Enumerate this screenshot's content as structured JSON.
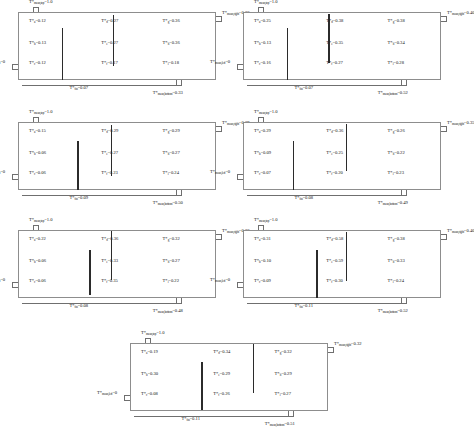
{
  "figure": {
    "symbol": "T*",
    "equals": "="
  },
  "panels": [
    {
      "id": "panel-1",
      "x": 18,
      "y": 12,
      "w": 198,
      "h": 68,
      "boundaries": {
        "top": {
          "sub": "mean,top",
          "value": "1.0",
          "label": "T*",
          "text": "T*mean,top=1.0"
        },
        "left": {
          "sub": "mean,left",
          "value": "0",
          "label": "T*",
          "text": "T*mean,left=0"
        },
        "right": {
          "sub": "mean,right",
          "value": "0.36",
          "label": "T*",
          "text": "T*mean,right=0.36"
        },
        "bottom": {
          "sub": "mean,bottom",
          "value": "0.33",
          "label": "T*",
          "text": "T*mean,bottom=0.33"
        },
        "inner": {
          "sub": "fin",
          "value": "0.07",
          "label": "T*",
          "text": "T*fin=0.07"
        }
      },
      "cells": [
        [
          {
            "sub": "a",
            "value": "0.12"
          },
          {
            "sub": "d",
            "value": "0.27"
          },
          {
            "sub": "g",
            "value": "0.36"
          }
        ],
        [
          {
            "sub": "b",
            "value": "0.13"
          },
          {
            "sub": "e",
            "value": "0.27"
          },
          {
            "sub": "h",
            "value": "0.36"
          }
        ],
        [
          {
            "sub": "c",
            "value": "0.12"
          },
          {
            "sub": "f",
            "value": "0.17"
          },
          {
            "sub": "i",
            "value": "0.18"
          }
        ]
      ],
      "bars": [
        {
          "xpct": 0.22,
          "ytop": 0.24,
          "ybot": 1.0
        },
        {
          "xpct": 0.48,
          "ytop": 0.05,
          "ybot": 0.8
        }
      ]
    },
    {
      "id": "panel-2",
      "x": 243,
      "y": 12,
      "w": 198,
      "h": 68,
      "boundaries": {
        "top": {
          "sub": "mean,top",
          "value": "1.0",
          "label": "T*",
          "text": "T*mean,top=1.0"
        },
        "left": {
          "sub": "mean,left",
          "value": "0",
          "label": "T*",
          "text": "T*mean,left=0"
        },
        "right": {
          "sub": "mean,right",
          "value": "0.40",
          "label": "T*",
          "text": "T*mean,right=0.40"
        },
        "bottom": {
          "sub": "mean,bottom",
          "value": "0.52",
          "label": "T*",
          "text": "T*mean,bottom=0.52"
        },
        "inner": {
          "sub": "fin",
          "value": "0.07",
          "label": "T*",
          "text": "T*fin=0.07"
        }
      },
      "cells": [
        [
          {
            "sub": "a",
            "value": "0.25"
          },
          {
            "sub": "d",
            "value": "0.38"
          },
          {
            "sub": "g",
            "value": "0.38"
          }
        ],
        [
          {
            "sub": "b",
            "value": "0.13"
          },
          {
            "sub": "e",
            "value": "0.35"
          },
          {
            "sub": "h",
            "value": "0.34"
          }
        ],
        [
          {
            "sub": "c",
            "value": "0.16"
          },
          {
            "sub": "f",
            "value": "0.27"
          },
          {
            "sub": "i",
            "value": "0.28"
          }
        ]
      ],
      "bars": [
        {
          "xpct": 0.22,
          "ytop": 0.24,
          "ybot": 1.0
        },
        {
          "xpct": 0.43,
          "ytop": 0.03,
          "ybot": 0.75
        }
      ]
    },
    {
      "id": "panel-3",
      "x": 18,
      "y": 122,
      "w": 198,
      "h": 68,
      "boundaries": {
        "top": {
          "sub": "mean,top",
          "value": "1.0",
          "label": "T*",
          "text": "T*mean,top=1.0"
        },
        "left": {
          "sub": "mean,left",
          "value": "0",
          "label": "T*",
          "text": "T*mean,left=0"
        },
        "right": {
          "sub": "mean,right",
          "value": "0.29",
          "label": "T*",
          "text": "T*mean,right=0.29"
        },
        "bottom": {
          "sub": "mean,bottom",
          "value": "0.50",
          "label": "T*",
          "text": "T*mean,bottom=0.50"
        },
        "inner": {
          "sub": "fin",
          "value": "0.09",
          "label": "T*",
          "text": "T*fin=0.09"
        }
      },
      "cells": [
        [
          {
            "sub": "a",
            "value": "0.15"
          },
          {
            "sub": "d",
            "value": "0.29"
          },
          {
            "sub": "g",
            "value": "0.29"
          }
        ],
        [
          {
            "sub": "b",
            "value": "0.06"
          },
          {
            "sub": "e",
            "value": "0.27"
          },
          {
            "sub": "h",
            "value": "0.27"
          }
        ],
        [
          {
            "sub": "c",
            "value": "0.06"
          },
          {
            "sub": "f",
            "value": "0.23"
          },
          {
            "sub": "i",
            "value": "0.24"
          }
        ]
      ],
      "bars": [
        {
          "xpct": 0.3,
          "ytop": 0.28,
          "ybot": 1.0
        },
        {
          "xpct": 0.47,
          "ytop": 0.05,
          "ybot": 0.8
        }
      ]
    },
    {
      "id": "panel-4",
      "x": 243,
      "y": 122,
      "w": 198,
      "h": 68,
      "boundaries": {
        "top": {
          "sub": "mean,top",
          "value": "1.0",
          "label": "T*",
          "text": "T*mean,top=1.0"
        },
        "left": {
          "sub": "mean,left",
          "value": "0",
          "label": "T*",
          "text": "T*mean,left=0"
        },
        "right": {
          "sub": "mean,right",
          "value": "0.35",
          "label": "T*",
          "text": "T*mean,right=0.35"
        },
        "bottom": {
          "sub": "mean,bottom",
          "value": "0.49",
          "label": "T*",
          "text": "T*mean,bottom=0.49"
        },
        "inner": {
          "sub": "fin",
          "value": "0.08",
          "label": "T*",
          "text": "T*fin=0.08"
        }
      },
      "cells": [
        [
          {
            "sub": "a",
            "value": "0.29"
          },
          {
            "sub": "d",
            "value": "0.36"
          },
          {
            "sub": "g",
            "value": "0.26"
          }
        ],
        [
          {
            "sub": "b",
            "value": "0.09"
          },
          {
            "sub": "e",
            "value": "0.25"
          },
          {
            "sub": "h",
            "value": "0.22"
          }
        ],
        [
          {
            "sub": "c",
            "value": "0.07"
          },
          {
            "sub": "f",
            "value": "0.20"
          },
          {
            "sub": "i",
            "value": "0.23"
          }
        ]
      ],
      "bars": [
        {
          "xpct": 0.25,
          "ytop": 0.28,
          "ybot": 1.0
        },
        {
          "xpct": 0.52,
          "ytop": 0.03,
          "ybot": 0.72
        }
      ]
    },
    {
      "id": "panel-5",
      "x": 18,
      "y": 230,
      "w": 198,
      "h": 68,
      "boundaries": {
        "top": {
          "sub": "mean,top",
          "value": "1.0",
          "label": "T*",
          "text": "T*mean,top=1.0"
        },
        "left": {
          "sub": "mean,left",
          "value": "0",
          "label": "T*",
          "text": "T*mean,left=0"
        },
        "right": {
          "sub": "mean,right",
          "value": "0.36",
          "label": "T*",
          "text": "T*mean,right=0.36"
        },
        "bottom": {
          "sub": "mean,bottom",
          "value": "0.48",
          "label": "T*",
          "text": "T*mean,bottom=0.48"
        },
        "inner": {
          "sub": "fin",
          "value": "0.08",
          "label": "T*",
          "text": "T*fin=0.08"
        }
      },
      "cells": [
        [
          {
            "sub": "a",
            "value": "0.22"
          },
          {
            "sub": "d",
            "value": "0.36"
          },
          {
            "sub": "g",
            "value": "0.32"
          }
        ],
        [
          {
            "sub": "b",
            "value": "0.06"
          },
          {
            "sub": "e",
            "value": "0.33"
          },
          {
            "sub": "h",
            "value": "0.27"
          }
        ],
        [
          {
            "sub": "c",
            "value": "0.06"
          },
          {
            "sub": "f",
            "value": "0.35"
          },
          {
            "sub": "i",
            "value": "0.22"
          }
        ]
      ],
      "bars": [
        {
          "xpct": 0.36,
          "ytop": 0.3,
          "ybot": 0.95
        },
        {
          "xpct": 0.47,
          "ytop": 0.02,
          "ybot": 0.74
        }
      ]
    },
    {
      "id": "panel-6",
      "x": 243,
      "y": 230,
      "w": 198,
      "h": 68,
      "boundaries": {
        "top": {
          "sub": "mean,top",
          "value": "1.0",
          "label": "T*",
          "text": "T*mean,top=1.0"
        },
        "left": {
          "sub": "mean,left",
          "value": "0",
          "label": "T*",
          "text": "T*mean,left=0"
        },
        "right": {
          "sub": "mean,right",
          "value": "0.40",
          "label": "T*",
          "text": "T*mean,right=0.40"
        },
        "bottom": {
          "sub": "mean,bottom",
          "value": "0.52",
          "label": "T*",
          "text": "T*mean,bottom=0.52"
        },
        "inner": {
          "sub": "fin",
          "value": "0.11",
          "label": "T*",
          "text": "T*fin=0.11"
        }
      },
      "cells": [
        [
          {
            "sub": "a",
            "value": "0.31"
          },
          {
            "sub": "d",
            "value": "0.58"
          },
          {
            "sub": "g",
            "value": "0.38"
          }
        ],
        [
          {
            "sub": "b",
            "value": "0.10"
          },
          {
            "sub": "e",
            "value": "0.59"
          },
          {
            "sub": "h",
            "value": "0.33"
          }
        ],
        [
          {
            "sub": "c",
            "value": "0.09"
          },
          {
            "sub": "f",
            "value": "0.30"
          },
          {
            "sub": "i",
            "value": "0.24"
          }
        ]
      ],
      "bars": [
        {
          "xpct": 0.37,
          "ytop": 0.3,
          "ybot": 1.0
        },
        {
          "xpct": 0.52,
          "ytop": 0.03,
          "ybot": 0.75
        }
      ]
    },
    {
      "id": "panel-7",
      "x": 130,
      "y": 343,
      "w": 198,
      "h": 68,
      "boundaries": {
        "top": {
          "sub": "mean,top",
          "value": "1.0",
          "label": "T*",
          "text": "T*mean,top=1.0"
        },
        "left": {
          "sub": "mean,left",
          "value": "0",
          "label": "T*",
          "text": "T*mean,left=0"
        },
        "right": {
          "sub": "mean,right",
          "value": "0.32",
          "label": "T*",
          "text": "T*mean,right=0.32"
        },
        "bottom": {
          "sub": "mean,bottom",
          "value": "0.51",
          "label": "T*",
          "text": "T*mean,bottom=0.51"
        },
        "inner": {
          "sub": "fin",
          "value": "0.11",
          "label": "T*",
          "text": "T*fin=0.11"
        }
      },
      "cells": [
        [
          {
            "sub": "a",
            "value": "0.19"
          },
          {
            "sub": "d",
            "value": "0.34"
          },
          {
            "sub": "g",
            "value": "0.32"
          }
        ],
        [
          {
            "sub": "b",
            "value": "0.30"
          },
          {
            "sub": "e",
            "value": "0.29"
          },
          {
            "sub": "h",
            "value": "0.29"
          }
        ],
        [
          {
            "sub": "c",
            "value": "0.08"
          },
          {
            "sub": "f",
            "value": "0.26"
          },
          {
            "sub": "i",
            "value": "0.27"
          }
        ]
      ],
      "bars": [
        {
          "xpct": 0.36,
          "ytop": 0.28,
          "ybot": 0.98
        },
        {
          "xpct": 0.62,
          "ytop": 0.02,
          "ybot": 0.74
        }
      ]
    }
  ]
}
